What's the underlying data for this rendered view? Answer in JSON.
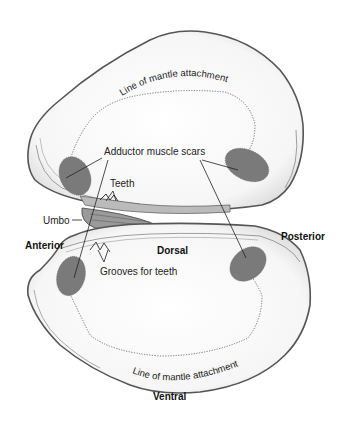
{
  "figure": {
    "colors": {
      "shell_outline": "#555555",
      "shell_fill": "#f7f7f7",
      "muscle_scar": "#7a7a7a",
      "mantle_line": "#666666",
      "label_text": "#222222"
    }
  },
  "labels": {
    "upper_mantle_line": "Line of mantle attachment",
    "adductor_scars": "Adductor muscle scars",
    "teeth": "Teeth",
    "umbo": "Umbo",
    "anterior": "Anterior",
    "dorsal": "Dorsal",
    "posterior": "Posterior",
    "grooves": "Grooves for teeth",
    "lower_mantle_line": "Line of mantle attachment",
    "ventral": "Ventral"
  }
}
